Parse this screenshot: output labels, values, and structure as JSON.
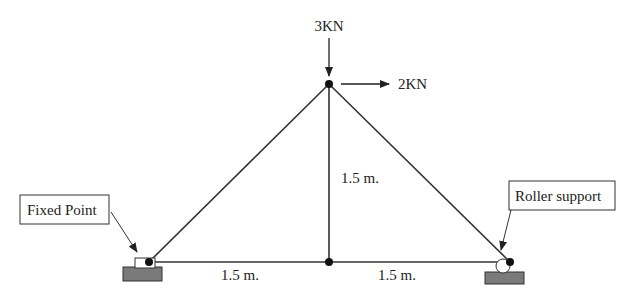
{
  "diagram": {
    "type": "truss",
    "colors": {
      "member": "#333333",
      "node": "#111111",
      "support_base": "#7a7a7a",
      "background": "#ffffff"
    },
    "nodes": [
      {
        "id": "left",
        "x": 149,
        "y": 262
      },
      {
        "id": "bottom-middle",
        "x": 329,
        "y": 262
      },
      {
        "id": "right",
        "x": 510,
        "y": 262
      },
      {
        "id": "top",
        "x": 329,
        "y": 84
      }
    ],
    "members": [
      [
        "left",
        "bottom-middle"
      ],
      [
        "bottom-middle",
        "right"
      ],
      [
        "left",
        "top"
      ],
      [
        "top",
        "right"
      ],
      [
        "bottom-middle",
        "top"
      ]
    ],
    "loads": {
      "vertical": {
        "label": "3KN",
        "direction": "down"
      },
      "horizontal": {
        "label": "2KN",
        "direction": "right"
      }
    },
    "dimensions": {
      "vertical": "1.5 m.",
      "bottom_left": "1.5 m.",
      "bottom_right": "1.5 m."
    },
    "callouts": {
      "left_support": "Fixed Point",
      "right_support": "Roller support"
    }
  }
}
